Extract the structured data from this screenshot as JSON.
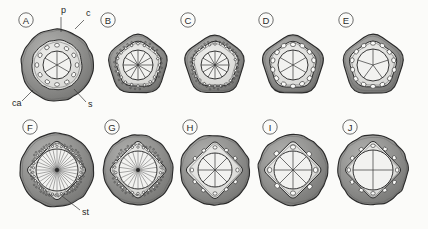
{
  "figure": {
    "background_color": "#fbfbf9",
    "ink_color": "#2b2b2b",
    "cortex_fill": "#8e8e8e",
    "stele_fill": "#d9d9d6",
    "pith_fill": "#f2f2f0",
    "rows": 2,
    "columns": 5
  },
  "annotations": [
    {
      "key": "p",
      "label": "p",
      "meaning": "pith",
      "panel": "A",
      "x": 61,
      "y": 13,
      "leader": [
        [
          61,
          17
        ],
        [
          61,
          32
        ]
      ]
    },
    {
      "key": "c",
      "label": "c",
      "meaning": "cortex",
      "panel": "A",
      "x": 86,
      "y": 16,
      "leader": [
        [
          84,
          20
        ],
        [
          75,
          29
        ]
      ]
    },
    {
      "key": "ca",
      "label": "ca",
      "meaning": "cambium",
      "panel": "A",
      "x": 12,
      "y": 106,
      "leader": [
        [
          22,
          101
        ],
        [
          33,
          90
        ]
      ]
    },
    {
      "key": "s",
      "label": "s",
      "meaning": "stele",
      "panel": "A",
      "x": 88,
      "y": 107,
      "leader": [
        [
          86,
          102
        ],
        [
          74,
          89
        ]
      ]
    },
    {
      "key": "st",
      "label": "st",
      "meaning": "strand",
      "panel": "F",
      "x": 82,
      "y": 215,
      "leader": [
        [
          80,
          210
        ],
        [
          62,
          196
        ]
      ]
    }
  ],
  "panels": [
    {
      "id": "A",
      "label": "A",
      "row": 0,
      "col": 0,
      "cx": 57,
      "cy": 65,
      "outer_r": 36,
      "letter_x": 26,
      "letter_y": 20,
      "outline_shape": "circle",
      "stele_shape": "circle",
      "stele_r": 25,
      "pith_r": 14,
      "spokes": 6,
      "vessel_count": 12,
      "vessel_rx": 2.4,
      "vessel_ry": 1.9,
      "vessel_orbit_r": 19.5,
      "cortex_band": 5.5,
      "dotted_ring": false
    },
    {
      "id": "B",
      "label": "B",
      "row": 0,
      "col": 1,
      "cx": 138,
      "cy": 65,
      "outer_r": 34,
      "letter_x": 108,
      "letter_y": 20,
      "outline_shape": "polygon5",
      "stele_shape": "polygon5",
      "stele_r": 26,
      "pith_r": 15,
      "spokes": 12,
      "vessel_count": 20,
      "vessel_rx": 1.3,
      "vessel_ry": 1.3,
      "vessel_orbit_r": 21,
      "cortex_band": 6,
      "dotted_ring": true
    },
    {
      "id": "C",
      "label": "C",
      "row": 0,
      "col": 2,
      "cx": 215,
      "cy": 65,
      "outer_r": 34,
      "letter_x": 188,
      "letter_y": 20,
      "outline_shape": "polygon5",
      "stele_shape": "polygon5",
      "stele_r": 26,
      "pith_r": 14,
      "spokes": 12,
      "vessel_count": 24,
      "vessel_rx": 1.2,
      "vessel_ry": 1.2,
      "vessel_orbit_r": 21.5,
      "cortex_band": 5,
      "dotted_ring": true
    },
    {
      "id": "D",
      "label": "D",
      "row": 0,
      "col": 3,
      "cx": 293,
      "cy": 65,
      "outer_r": 34,
      "letter_x": 266,
      "letter_y": 20,
      "outline_shape": "polygon5",
      "stele_shape": "polygon5",
      "stele_r": 27,
      "pith_r": 15,
      "spokes": 6,
      "vessel_count": 14,
      "vessel_rx": 2.6,
      "vessel_ry": 2.1,
      "vessel_orbit_r": 21,
      "cortex_band": 4.5,
      "dotted_ring": false
    },
    {
      "id": "E",
      "label": "E",
      "row": 0,
      "col": 4,
      "cx": 373,
      "cy": 65,
      "outer_r": 34,
      "letter_x": 346,
      "letter_y": 20,
      "outline_shape": "polygon5",
      "stele_shape": "polygon5",
      "stele_r": 27,
      "pith_r": 16,
      "spokes": 5,
      "vessel_count": 14,
      "vessel_rx": 2.5,
      "vessel_ry": 2.0,
      "vessel_orbit_r": 21.5,
      "cortex_band": 4.5,
      "dotted_ring": false
    },
    {
      "id": "F",
      "label": "F",
      "row": 1,
      "col": 0,
      "cx": 57,
      "cy": 170,
      "outer_r": 37,
      "letter_x": 30,
      "letter_y": 127,
      "outline_shape": "circle",
      "stele_shape": "diamond",
      "stele_r": 31,
      "pith_r": 21,
      "spokes": 32,
      "vessel_count": 34,
      "vessel_rx": 1.1,
      "vessel_ry": 1.1,
      "vessel_orbit_r": 24,
      "cortex_band": 7,
      "dotted_ring": true
    },
    {
      "id": "G",
      "label": "G",
      "row": 1,
      "col": 1,
      "cx": 138,
      "cy": 170,
      "outer_r": 35,
      "letter_x": 112,
      "letter_y": 127,
      "outline_shape": "circle",
      "stele_shape": "diamond",
      "stele_r": 30,
      "pith_r": 19,
      "spokes": 22,
      "vessel_count": 26,
      "vessel_rx": 1.2,
      "vessel_ry": 1.2,
      "vessel_orbit_r": 23,
      "cortex_band": 7,
      "dotted_ring": true
    },
    {
      "id": "H",
      "label": "H",
      "row": 1,
      "col": 2,
      "cx": 215,
      "cy": 170,
      "outer_r": 35,
      "letter_x": 190,
      "letter_y": 127,
      "outline_shape": "circle",
      "stele_shape": "diamond",
      "stele_r": 30,
      "pith_r": 17,
      "spokes": 8,
      "vessel_count": 12,
      "vessel_rx": 2.0,
      "vessel_ry": 1.7,
      "vessel_orbit_r": 23,
      "cortex_band": 7,
      "dotted_ring": false
    },
    {
      "id": "I",
      "label": "I",
      "row": 1,
      "col": 3,
      "cx": 293,
      "cy": 170,
      "outer_r": 35,
      "letter_x": 270,
      "letter_y": 127,
      "outline_shape": "circle",
      "stele_shape": "diamond",
      "stele_r": 30,
      "pith_r": 19,
      "spokes": 8,
      "vessel_count": 8,
      "vessel_rx": 2.6,
      "vessel_ry": 2.2,
      "vessel_orbit_r": 23,
      "cortex_band": 7,
      "dotted_ring": false
    },
    {
      "id": "J",
      "label": "J",
      "row": 1,
      "col": 4,
      "cx": 373,
      "cy": 170,
      "outer_r": 35,
      "letter_x": 350,
      "letter_y": 127,
      "outline_shape": "circle",
      "stele_shape": "diamond",
      "stele_r": 30,
      "pith_r": 20,
      "spokes": 4,
      "vessel_count": 12,
      "vessel_rx": 2.2,
      "vessel_ry": 1.8,
      "vessel_orbit_r": 24,
      "cortex_band": 7,
      "dotted_ring": false
    }
  ]
}
